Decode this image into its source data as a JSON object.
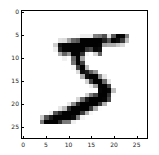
{
  "chart_data": {
    "type": "heatmap",
    "title": "",
    "xlabel": "",
    "ylabel": "",
    "colormap": "gray_r",
    "shape": [
      28,
      28
    ],
    "xlim": [
      -0.5,
      27.5
    ],
    "ylim": [
      27.5,
      -0.5
    ],
    "xticks": [
      0,
      5,
      10,
      15,
      20,
      25
    ],
    "yticks": [
      0,
      5,
      10,
      15,
      20,
      25
    ],
    "grid": false,
    "values": [
      [
        0,
        0,
        0,
        0,
        0,
        0,
        0,
        0,
        0,
        0,
        0,
        0,
        0,
        0,
        0,
        0,
        0,
        0,
        0,
        0,
        0,
        0,
        0,
        0,
        0,
        0,
        0,
        0
      ],
      [
        0,
        0,
        0,
        0,
        0,
        0,
        0,
        0,
        0,
        0,
        0,
        0,
        0,
        0,
        0,
        0,
        0,
        0,
        0,
        0,
        0,
        0,
        0,
        0,
        0,
        0,
        0,
        0
      ],
      [
        0,
        0,
        0,
        0,
        0,
        0,
        0,
        0,
        0,
        0,
        0,
        0,
        0,
        0,
        0,
        0,
        0,
        0,
        0,
        0,
        0,
        0,
        0,
        0,
        0,
        0,
        0,
        0
      ],
      [
        0,
        0,
        0,
        0,
        0,
        0,
        0,
        0,
        0,
        0,
        0,
        0,
        0,
        0,
        0,
        0,
        0,
        0,
        0,
        0,
        0,
        0,
        0,
        0,
        0,
        0,
        0,
        0
      ],
      [
        0,
        0,
        0,
        0,
        0,
        0,
        0,
        0,
        0,
        0,
        0,
        0,
        0,
        0,
        0,
        0,
        0,
        0,
        0,
        0,
        0,
        0,
        0,
        0,
        0,
        0,
        0,
        0
      ],
      [
        0,
        0,
        0,
        0,
        0,
        0,
        0,
        0,
        0,
        0,
        0,
        0,
        3,
        18,
        18,
        18,
        126,
        136,
        175,
        26,
        166,
        255,
        247,
        127,
        0,
        0,
        0,
        0
      ],
      [
        0,
        0,
        0,
        0,
        0,
        0,
        0,
        0,
        30,
        36,
        94,
        154,
        170,
        253,
        253,
        253,
        253,
        253,
        225,
        172,
        253,
        242,
        195,
        64,
        0,
        0,
        0,
        0
      ],
      [
        0,
        0,
        0,
        0,
        0,
        0,
        0,
        49,
        238,
        253,
        253,
        253,
        253,
        253,
        253,
        253,
        253,
        251,
        93,
        82,
        82,
        56,
        39,
        0,
        0,
        0,
        0,
        0
      ],
      [
        0,
        0,
        0,
        0,
        0,
        0,
        0,
        18,
        219,
        253,
        253,
        253,
        253,
        253,
        198,
        182,
        247,
        241,
        0,
        0,
        0,
        0,
        0,
        0,
        0,
        0,
        0,
        0
      ],
      [
        0,
        0,
        0,
        0,
        0,
        0,
        0,
        0,
        80,
        156,
        107,
        253,
        253,
        205,
        11,
        0,
        43,
        154,
        0,
        0,
        0,
        0,
        0,
        0,
        0,
        0,
        0,
        0
      ],
      [
        0,
        0,
        0,
        0,
        0,
        0,
        0,
        0,
        0,
        14,
        1,
        154,
        253,
        90,
        0,
        0,
        0,
        0,
        0,
        0,
        0,
        0,
        0,
        0,
        0,
        0,
        0,
        0
      ],
      [
        0,
        0,
        0,
        0,
        0,
        0,
        0,
        0,
        0,
        0,
        0,
        139,
        253,
        190,
        2,
        0,
        0,
        0,
        0,
        0,
        0,
        0,
        0,
        0,
        0,
        0,
        0,
        0
      ],
      [
        0,
        0,
        0,
        0,
        0,
        0,
        0,
        0,
        0,
        0,
        0,
        11,
        190,
        253,
        70,
        0,
        0,
        0,
        0,
        0,
        0,
        0,
        0,
        0,
        0,
        0,
        0,
        0
      ],
      [
        0,
        0,
        0,
        0,
        0,
        0,
        0,
        0,
        0,
        0,
        0,
        0,
        35,
        241,
        225,
        160,
        108,
        1,
        0,
        0,
        0,
        0,
        0,
        0,
        0,
        0,
        0,
        0
      ],
      [
        0,
        0,
        0,
        0,
        0,
        0,
        0,
        0,
        0,
        0,
        0,
        0,
        0,
        81,
        240,
        253,
        253,
        119,
        25,
        0,
        0,
        0,
        0,
        0,
        0,
        0,
        0,
        0
      ],
      [
        0,
        0,
        0,
        0,
        0,
        0,
        0,
        0,
        0,
        0,
        0,
        0,
        0,
        0,
        45,
        186,
        253,
        253,
        150,
        27,
        0,
        0,
        0,
        0,
        0,
        0,
        0,
        0
      ],
      [
        0,
        0,
        0,
        0,
        0,
        0,
        0,
        0,
        0,
        0,
        0,
        0,
        0,
        0,
        0,
        16,
        93,
        252,
        253,
        187,
        0,
        0,
        0,
        0,
        0,
        0,
        0,
        0
      ],
      [
        0,
        0,
        0,
        0,
        0,
        0,
        0,
        0,
        0,
        0,
        0,
        0,
        0,
        0,
        0,
        0,
        0,
        249,
        253,
        249,
        64,
        0,
        0,
        0,
        0,
        0,
        0,
        0
      ],
      [
        0,
        0,
        0,
        0,
        0,
        0,
        0,
        0,
        0,
        0,
        0,
        0,
        0,
        0,
        46,
        130,
        183,
        253,
        253,
        207,
        2,
        0,
        0,
        0,
        0,
        0,
        0,
        0
      ],
      [
        0,
        0,
        0,
        0,
        0,
        0,
        0,
        0,
        0,
        0,
        0,
        0,
        39,
        148,
        229,
        253,
        253,
        253,
        250,
        182,
        0,
        0,
        0,
        0,
        0,
        0,
        0,
        0
      ],
      [
        0,
        0,
        0,
        0,
        0,
        0,
        0,
        0,
        0,
        0,
        24,
        114,
        221,
        253,
        253,
        253,
        253,
        201,
        78,
        0,
        0,
        0,
        0,
        0,
        0,
        0,
        0,
        0
      ],
      [
        0,
        0,
        0,
        0,
        0,
        0,
        0,
        0,
        23,
        66,
        213,
        253,
        253,
        253,
        253,
        198,
        81,
        2,
        0,
        0,
        0,
        0,
        0,
        0,
        0,
        0,
        0,
        0
      ],
      [
        0,
        0,
        0,
        0,
        0,
        0,
        18,
        171,
        219,
        253,
        253,
        253,
        253,
        195,
        80,
        9,
        0,
        0,
        0,
        0,
        0,
        0,
        0,
        0,
        0,
        0,
        0,
        0
      ],
      [
        0,
        0,
        0,
        0,
        55,
        172,
        226,
        253,
        253,
        253,
        253,
        244,
        133,
        11,
        0,
        0,
        0,
        0,
        0,
        0,
        0,
        0,
        0,
        0,
        0,
        0,
        0,
        0
      ],
      [
        0,
        0,
        0,
        0,
        136,
        253,
        253,
        253,
        212,
        135,
        132,
        16,
        0,
        0,
        0,
        0,
        0,
        0,
        0,
        0,
        0,
        0,
        0,
        0,
        0,
        0,
        0,
        0
      ],
      [
        0,
        0,
        0,
        0,
        0,
        0,
        0,
        0,
        0,
        0,
        0,
        0,
        0,
        0,
        0,
        0,
        0,
        0,
        0,
        0,
        0,
        0,
        0,
        0,
        0,
        0,
        0,
        0
      ],
      [
        0,
        0,
        0,
        0,
        0,
        0,
        0,
        0,
        0,
        0,
        0,
        0,
        0,
        0,
        0,
        0,
        0,
        0,
        0,
        0,
        0,
        0,
        0,
        0,
        0,
        0,
        0,
        0
      ],
      [
        0,
        0,
        0,
        0,
        0,
        0,
        0,
        0,
        0,
        0,
        0,
        0,
        0,
        0,
        0,
        0,
        0,
        0,
        0,
        0,
        0,
        0,
        0,
        0,
        0,
        0,
        0,
        0
      ]
    ]
  },
  "axes": {
    "x_tick_labels": [
      "0",
      "5",
      "10",
      "15",
      "20",
      "25"
    ],
    "y_tick_labels": [
      "0",
      "5",
      "10",
      "15",
      "20",
      "25"
    ]
  }
}
